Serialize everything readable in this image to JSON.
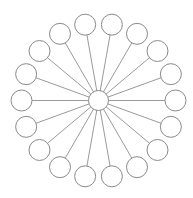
{
  "diagram": {
    "type": "hub-and-spoke",
    "width": 193,
    "height": 198,
    "background": "#ffffff",
    "hub": {
      "cx": 98.5,
      "cy": 100.5,
      "r": 10
    },
    "spokes": {
      "count": 18,
      "ring_radius": 77,
      "start_angle_deg": 10,
      "step_deg": 20,
      "node_radius": 10.5
    },
    "colors": {
      "stroke": "#8a8a8a",
      "line": "#9a9a9a",
      "fill": "#ffffff"
    }
  }
}
